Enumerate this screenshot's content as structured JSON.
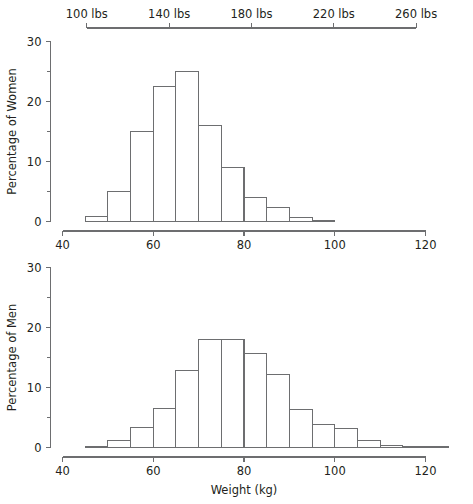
{
  "figure": {
    "width": 473,
    "height": 504,
    "background": "#ffffff",
    "line_color": "#6d6e70",
    "text_color": "#231f20"
  },
  "chart_data": [
    {
      "type": "bar",
      "id": "women-histogram",
      "title": "",
      "subtitle": "",
      "xlabel": "",
      "ylabel": "Percentage of Women",
      "secondary_xlabel": "",
      "xlim": [
        40,
        120
      ],
      "ylim": [
        0,
        30
      ],
      "grid": false,
      "legend": "none",
      "bin_width": 5,
      "categories": [
        "45-50",
        "50-55",
        "55-60",
        "60-65",
        "65-70",
        "70-75",
        "75-80",
        "80-85",
        "85-90",
        "90-95",
        "95-100"
      ],
      "bin_edges": [
        45,
        50,
        55,
        60,
        65,
        70,
        75,
        80,
        85,
        90,
        95,
        100
      ],
      "values": [
        0.8,
        5.0,
        15.0,
        22.5,
        25.0,
        16.0,
        9.0,
        4.0,
        2.3,
        0.7,
        0.2
      ],
      "xticks": [
        40,
        60,
        80,
        100,
        120
      ],
      "xticklabels": [
        "40",
        "60",
        "80",
        "100",
        "120"
      ],
      "yticks": [
        0,
        10,
        20,
        30
      ],
      "yticklabels": [
        "0",
        "10",
        "20",
        "30"
      ],
      "yminorticks": [
        5,
        15,
        25
      ],
      "secondary_axis": {
        "position": "top",
        "unit": "lbs",
        "ticks_kg": [
          45.36,
          63.5,
          81.65,
          99.79,
          117.93
        ],
        "ticklabels": [
          "100 lbs",
          "140 lbs",
          "180 lbs",
          "220 lbs",
          "260 lbs"
        ]
      }
    },
    {
      "type": "bar",
      "id": "men-histogram",
      "title": "",
      "subtitle": "",
      "xlabel": "Weight (kg)",
      "ylabel": "Percentage of Men",
      "xlim": [
        40,
        120
      ],
      "ylim": [
        0,
        30
      ],
      "grid": false,
      "legend": "none",
      "bin_width": 5,
      "categories": [
        "45-50",
        "50-55",
        "55-60",
        "60-65",
        "65-70",
        "70-75",
        "75-80",
        "80-85",
        "85-90",
        "90-95",
        "95-100",
        "100-105",
        "105-110",
        "110-115",
        "115-120",
        "120-125"
      ],
      "bin_edges": [
        45,
        50,
        55,
        60,
        65,
        70,
        75,
        80,
        85,
        90,
        95,
        100,
        105,
        110,
        115,
        120,
        125
      ],
      "values": [
        0.2,
        1.2,
        3.3,
        6.5,
        12.8,
        18.0,
        18.0,
        15.7,
        12.2,
        6.4,
        3.9,
        3.2,
        1.2,
        0.3,
        0.1,
        0.05
      ],
      "xticks": [
        40,
        60,
        80,
        100,
        120
      ],
      "xticklabels": [
        "40",
        "60",
        "80",
        "100",
        "120"
      ],
      "yticks": [
        0,
        10,
        20,
        30
      ],
      "yticklabels": [
        "0",
        "10",
        "20",
        "30"
      ],
      "yminorticks": [
        5,
        15,
        25
      ]
    }
  ]
}
